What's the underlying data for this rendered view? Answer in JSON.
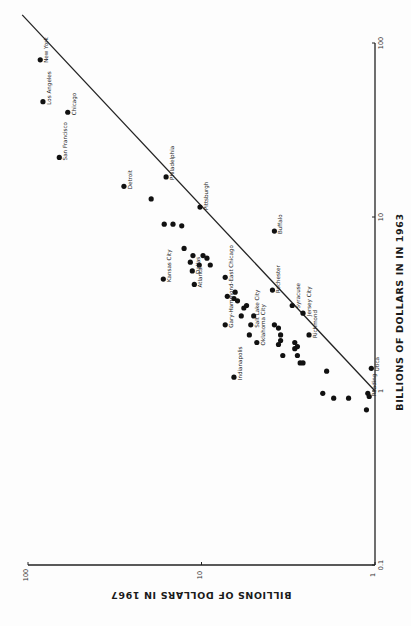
{
  "chart_data": {
    "type": "scatter",
    "orientation": "page rotated 90 degrees counter-clockwise; 1963 axis runs vertically along right edge, 1967 axis runs horizontally along bottom (upside-down text)",
    "title": "",
    "xlabel": "BILLIONS OF DOLLARS IN IN 1963",
    "ylabel": "BILLIONS OF DOLLARS IN 1967",
    "x_scale": "log",
    "y_scale": "log",
    "xlim": [
      0.1,
      100
    ],
    "ylim": [
      1,
      100
    ],
    "x_ticks": [
      "0.1",
      "1",
      "10",
      "100"
    ],
    "y_ticks": [
      "1",
      "10",
      "100"
    ],
    "grid": false,
    "legend": null,
    "reference_line": {
      "label": "y = x (equal values)",
      "from": [
        1,
        1
      ],
      "to": [
        100,
        100
      ]
    },
    "points": [
      {
        "label": "New York",
        "x1963": 80,
        "y1967": 85
      },
      {
        "label": "Los Angeles",
        "x1963": 46,
        "y1967": 82
      },
      {
        "label": "Chicago",
        "x1963": 40,
        "y1967": 59
      },
      {
        "label": "San Francisco",
        "x1963": 22,
        "y1967": 66
      },
      {
        "label": "Detroit",
        "x1963": 15,
        "y1967": 28
      },
      {
        "label": "Philadelphia",
        "x1963": 17,
        "y1967": 16
      },
      {
        "label": "",
        "x1963": 12.7,
        "y1967": 19.5
      },
      {
        "label": "Pittsburgh",
        "x1963": 11.4,
        "y1967": 10.2
      },
      {
        "label": "",
        "x1963": 9.1,
        "y1967": 16.4
      },
      {
        "label": "",
        "x1963": 9.1,
        "y1967": 14.6
      },
      {
        "label": "",
        "x1963": 8.9,
        "y1967": 13.0
      },
      {
        "label": "Buffalo",
        "x1963": 8.3,
        "y1967": 3.8
      },
      {
        "label": "",
        "x1963": 6.6,
        "y1967": 12.6
      },
      {
        "label": "",
        "x1963": 6.0,
        "y1967": 11.2
      },
      {
        "label": "",
        "x1963": 6.0,
        "y1967": 9.8
      },
      {
        "label": "",
        "x1963": 5.8,
        "y1967": 9.3
      },
      {
        "label": "",
        "x1963": 5.5,
        "y1967": 11.6
      },
      {
        "label": "",
        "x1963": 5.3,
        "y1967": 10.3
      },
      {
        "label": "Dallas",
        "x1963": 4.9,
        "y1967": 11.3
      },
      {
        "label": "",
        "x1963": 5.3,
        "y1967": 8.9
      },
      {
        "label": "",
        "x1963": 4.5,
        "y1967": 7.3
      },
      {
        "label": "Kansas City",
        "x1963": 4.4,
        "y1967": 16.6
      },
      {
        "label": "Atlanta",
        "x1963": 4.1,
        "y1967": 11.0
      },
      {
        "label": "",
        "x1963": 3.7,
        "y1967": 6.4
      },
      {
        "label": "",
        "x1963": 3.5,
        "y1967": 7.1
      },
      {
        "label": "",
        "x1963": 3.4,
        "y1967": 6.5
      },
      {
        "label": "",
        "x1963": 3.3,
        "y1967": 6.2
      },
      {
        "label": "Rochester",
        "x1963": 3.8,
        "y1967": 3.9
      },
      {
        "label": "",
        "x1963": 3.1,
        "y1967": 5.5
      },
      {
        "label": "",
        "x1963": 3.0,
        "y1967": 5.7
      },
      {
        "label": "",
        "x1963": 2.7,
        "y1967": 5.9
      },
      {
        "label": "",
        "x1963": 2.7,
        "y1967": 5.0
      },
      {
        "label": "Syracuse",
        "x1963": 3.1,
        "y1967": 3.0
      },
      {
        "label": "Jersey City",
        "x1963": 2.8,
        "y1967": 2.6
      },
      {
        "label": "Gary-Hammond-East Chicago",
        "x1963": 2.4,
        "y1967": 7.3
      },
      {
        "label": "Salt Lake City",
        "x1963": 2.4,
        "y1967": 5.2
      },
      {
        "label": "",
        "x1963": 2.1,
        "y1967": 5.3
      },
      {
        "label": "Oklahoma City",
        "x1963": 1.9,
        "y1967": 4.8
      },
      {
        "label": "",
        "x1963": 2.4,
        "y1967": 3.8
      },
      {
        "label": "",
        "x1963": 2.3,
        "y1967": 3.6
      },
      {
        "label": "",
        "x1963": 2.1,
        "y1967": 3.5
      },
      {
        "label": "",
        "x1963": 1.95,
        "y1967": 3.5
      },
      {
        "label": "",
        "x1963": 1.85,
        "y1967": 3.6
      },
      {
        "label": "",
        "x1963": 1.9,
        "y1967": 2.9
      },
      {
        "label": "",
        "x1963": 1.8,
        "y1967": 2.8
      },
      {
        "label": "",
        "x1963": 1.75,
        "y1967": 2.9
      },
      {
        "label": "Richmond",
        "x1963": 2.1,
        "y1967": 2.4
      },
      {
        "label": "",
        "x1963": 1.6,
        "y1967": 3.4
      },
      {
        "label": "",
        "x1963": 1.6,
        "y1967": 2.8
      },
      {
        "label": "",
        "x1963": 1.45,
        "y1967": 2.7
      },
      {
        "label": "",
        "x1963": 1.45,
        "y1967": 2.6
      },
      {
        "label": "Indianapolis",
        "x1963": 1.2,
        "y1967": 6.5
      },
      {
        "label": "",
        "x1963": 1.3,
        "y1967": 1.9
      },
      {
        "label": "Utica",
        "x1963": 1.35,
        "y1967": 1.05
      },
      {
        "label": "",
        "x1963": 0.97,
        "y1967": 2.0
      },
      {
        "label": "",
        "x1963": 0.91,
        "y1967": 1.73
      },
      {
        "label": "",
        "x1963": 0.91,
        "y1967": 1.42
      },
      {
        "label": "Reading",
        "x1963": 0.97,
        "y1967": 1.1
      },
      {
        "label": "",
        "x1963": 0.93,
        "y1967": 1.08
      },
      {
        "label": "",
        "x1963": 0.78,
        "y1967": 1.12
      }
    ]
  },
  "axes": {
    "x_title": "BILLIONS OF DOLLARS IN IN 1963",
    "y_title": "BILLIONS OF DOLLARS IN 1967",
    "x_tick_labels": [
      "0.1",
      "1",
      "10",
      "100"
    ],
    "y_tick_labels": [
      "1",
      "10",
      "100"
    ]
  }
}
